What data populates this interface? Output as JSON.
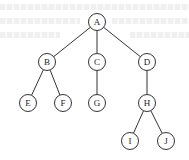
{
  "diagram": {
    "type": "tree",
    "node_radius": 8.5,
    "stroke_color": "#333333",
    "fill_color": "#ffffff",
    "nodes": [
      {
        "id": "A",
        "label": "A",
        "x": 97,
        "y": 22
      },
      {
        "id": "B",
        "label": "B",
        "x": 47,
        "y": 62
      },
      {
        "id": "C",
        "label": "C",
        "x": 97,
        "y": 62
      },
      {
        "id": "D",
        "label": "D",
        "x": 147,
        "y": 62
      },
      {
        "id": "E",
        "label": "E",
        "x": 28,
        "y": 103
      },
      {
        "id": "F",
        "label": "F",
        "x": 63,
        "y": 103
      },
      {
        "id": "G",
        "label": "G",
        "x": 97,
        "y": 103
      },
      {
        "id": "H",
        "label": "H",
        "x": 147,
        "y": 103
      },
      {
        "id": "I",
        "label": "I",
        "x": 130,
        "y": 141
      },
      {
        "id": "J",
        "label": "J",
        "x": 166,
        "y": 141
      }
    ],
    "edges": [
      {
        "from": "A",
        "to": "B"
      },
      {
        "from": "A",
        "to": "C"
      },
      {
        "from": "A",
        "to": "D"
      },
      {
        "from": "B",
        "to": "E"
      },
      {
        "from": "B",
        "to": "F"
      },
      {
        "from": "C",
        "to": "G"
      },
      {
        "from": "D",
        "to": "H"
      },
      {
        "from": "H",
        "to": "I"
      },
      {
        "from": "H",
        "to": "J"
      }
    ]
  }
}
